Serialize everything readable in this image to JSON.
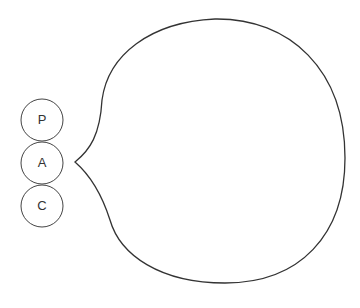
{
  "diagram": {
    "circles": [
      {
        "label": "P"
      },
      {
        "label": "A"
      },
      {
        "label": "C"
      }
    ],
    "stroke_color": "#333333",
    "background": "#ffffff"
  }
}
